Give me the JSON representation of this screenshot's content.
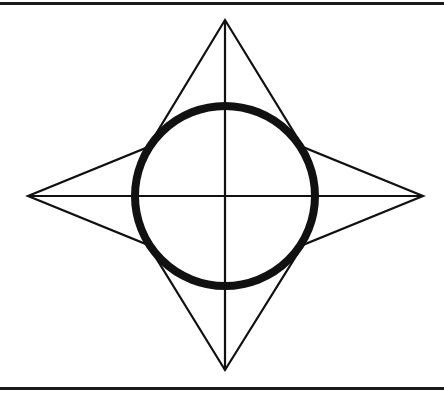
{
  "page": {
    "width": 444,
    "height": 399,
    "background_color": "#ffffff"
  },
  "frame": {
    "top_rule": {
      "name": "top-border-rule",
      "y": 2,
      "thickness": 3,
      "color": "#1a1a1a"
    },
    "bottom_rule": {
      "name": "bottom-border-rule",
      "y": 387,
      "thickness": 3,
      "color": "#1a1a1a"
    }
  },
  "figure": {
    "center": {
      "x": 225,
      "y": 196
    },
    "stroke_color": "#111111",
    "fill": "none",
    "star": {
      "name": "four-pointed-star",
      "stroke_width": 2.2,
      "outer_points": [
        {
          "label": "top",
          "x": 225,
          "y": 20
        },
        {
          "label": "right",
          "x": 423,
          "y": 196
        },
        {
          "label": "bottom",
          "x": 225,
          "y": 370
        },
        {
          "label": "left",
          "x": 28,
          "y": 196
        }
      ],
      "inner_points": [
        {
          "label": "top-right",
          "x": 303,
          "y": 147
        },
        {
          "label": "bottom-right",
          "x": 303,
          "y": 245
        },
        {
          "label": "bottom-left",
          "x": 148,
          "y": 245
        },
        {
          "label": "top-left",
          "x": 148,
          "y": 147
        }
      ],
      "path": "M 225 20 L 303 147 L 423 196 L 303 245 L 225 370 L 148 245 L 28 196 L 148 147 Z"
    },
    "circle": {
      "name": "center-circle",
      "cx": 225,
      "cy": 196,
      "radius": 90,
      "stroke_width": 8,
      "stroke_color": "#111111"
    },
    "crosshair": {
      "name": "crosshair-axes",
      "stroke_width": 2.2,
      "vertical": {
        "x": 225,
        "y1": 20,
        "y2": 370
      },
      "horizontal": {
        "y": 196,
        "x1": 28,
        "x2": 423
      }
    }
  }
}
